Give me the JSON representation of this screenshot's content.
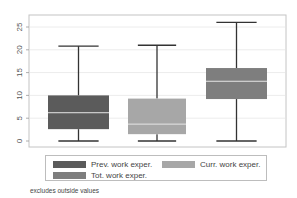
{
  "chart_data": {
    "type": "box",
    "title": "",
    "xlabel": "",
    "ylabel": "",
    "ylim": [
      0,
      26
    ],
    "yticks": [
      0,
      5,
      10,
      15,
      20,
      25
    ],
    "ytick_labels": [
      "0",
      "5",
      "10",
      "15",
      "20",
      "25"
    ],
    "grid": true,
    "legend_position": "bottom",
    "series": [
      {
        "name": "Prev. work exper.",
        "color": "#5b5b5b",
        "min": 0,
        "q1": 2.6,
        "median": 6.2,
        "q3": 10,
        "max": 20.8
      },
      {
        "name": "Curr. work exper.",
        "color": "#a7a7a7",
        "min": 0,
        "q1": 1.5,
        "median": 3.7,
        "q3": 9.3,
        "max": 21
      },
      {
        "name": "Tot. work exper.",
        "color": "#7e7e7e",
        "min": 0,
        "q1": 9.2,
        "median": 13.1,
        "q3": 16,
        "max": 26
      }
    ],
    "note": "excludes outside values"
  },
  "legend": {
    "items": [
      {
        "label": "Prev. work exper.",
        "color": "#5b5b5b"
      },
      {
        "label": "Curr. work exper.",
        "color": "#a7a7a7"
      },
      {
        "label": "Tot. work exper.",
        "color": "#7e7e7e"
      }
    ]
  },
  "footer": {
    "note": "excludes outside values"
  },
  "colors": {
    "frame": "#c4c4c4",
    "grid": "#ececec",
    "whisker": "#333333",
    "median": "#e6e6e6"
  }
}
